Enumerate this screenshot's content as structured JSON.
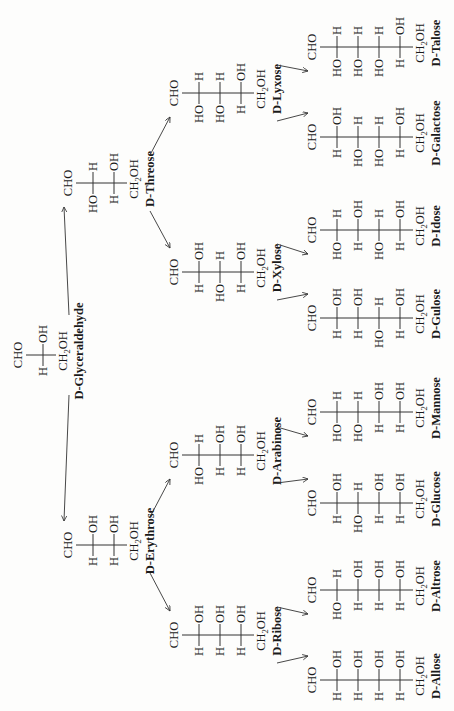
{
  "top_group": "CHO",
  "bottom_group": "CH2OH",
  "sugars": [
    {
      "id": "glyceraldehyde",
      "name": "D-Glyceraldehyde",
      "level": 3,
      "rows": [
        [
          "H",
          "OH"
        ]
      ]
    },
    {
      "id": "erythrose",
      "name": "D-Erythrose",
      "level": 4,
      "rows": [
        [
          "H",
          "OH"
        ],
        [
          "H",
          "OH"
        ]
      ],
      "parent": "glyceraldehyde"
    },
    {
      "id": "threose",
      "name": "D-Threose",
      "level": 4,
      "rows": [
        [
          "HO",
          "H"
        ],
        [
          "H",
          "OH"
        ]
      ],
      "parent": "glyceraldehyde"
    },
    {
      "id": "ribose",
      "name": "D-Ribose",
      "level": 5,
      "rows": [
        [
          "H",
          "OH"
        ],
        [
          "H",
          "OH"
        ],
        [
          "H",
          "OH"
        ]
      ],
      "parent": "erythrose"
    },
    {
      "id": "arabinose",
      "name": "D-Arabinose",
      "level": 5,
      "rows": [
        [
          "HO",
          "H"
        ],
        [
          "H",
          "OH"
        ],
        [
          "H",
          "OH"
        ]
      ],
      "parent": "erythrose"
    },
    {
      "id": "xylose",
      "name": "D-Xylose",
      "level": 5,
      "rows": [
        [
          "H",
          "OH"
        ],
        [
          "HO",
          "H"
        ],
        [
          "H",
          "OH"
        ]
      ],
      "parent": "threose"
    },
    {
      "id": "lyxose",
      "name": "D-Lyxose",
      "level": 5,
      "rows": [
        [
          "HO",
          "H"
        ],
        [
          "HO",
          "H"
        ],
        [
          "H",
          "OH"
        ]
      ],
      "parent": "threose"
    },
    {
      "id": "allose",
      "name": "D-Allose",
      "level": 6,
      "rows": [
        [
          "H",
          "OH"
        ],
        [
          "H",
          "OH"
        ],
        [
          "H",
          "OH"
        ],
        [
          "H",
          "OH"
        ]
      ],
      "parent": "ribose"
    },
    {
      "id": "altrose",
      "name": "D-Altrose",
      "level": 6,
      "rows": [
        [
          "HO",
          "H"
        ],
        [
          "H",
          "OH"
        ],
        [
          "H",
          "OH"
        ],
        [
          "H",
          "OH"
        ]
      ],
      "parent": "ribose"
    },
    {
      "id": "glucose",
      "name": "D-Glucose",
      "level": 6,
      "rows": [
        [
          "H",
          "OH"
        ],
        [
          "HO",
          "H"
        ],
        [
          "H",
          "OH"
        ],
        [
          "H",
          "OH"
        ]
      ],
      "parent": "arabinose"
    },
    {
      "id": "mannose",
      "name": "D-Mannose",
      "level": 6,
      "rows": [
        [
          "HO",
          "H"
        ],
        [
          "HO",
          "H"
        ],
        [
          "H",
          "OH"
        ],
        [
          "H",
          "OH"
        ]
      ],
      "parent": "arabinose"
    },
    {
      "id": "gulose",
      "name": "D-Gulose",
      "level": 6,
      "rows": [
        [
          "H",
          "OH"
        ],
        [
          "H",
          "OH"
        ],
        [
          "HO",
          "H"
        ],
        [
          "H",
          "OH"
        ]
      ],
      "parent": "xylose"
    },
    {
      "id": "idose",
      "name": "D-Idose",
      "level": 6,
      "rows": [
        [
          "HO",
          "H"
        ],
        [
          "H",
          "OH"
        ],
        [
          "HO",
          "H"
        ],
        [
          "H",
          "OH"
        ]
      ],
      "parent": "xylose"
    },
    {
      "id": "galactose",
      "name": "D-Galactose",
      "level": 6,
      "rows": [
        [
          "H",
          "OH"
        ],
        [
          "HO",
          "H"
        ],
        [
          "HO",
          "H"
        ],
        [
          "H",
          "OH"
        ]
      ],
      "parent": "lyxose"
    },
    {
      "id": "talose",
      "name": "D-Talose",
      "level": 6,
      "rows": [
        [
          "HO",
          "H"
        ],
        [
          "HO",
          "H"
        ],
        [
          "HO",
          "H"
        ],
        [
          "H",
          "OH"
        ]
      ],
      "parent": "lyxose"
    }
  ]
}
